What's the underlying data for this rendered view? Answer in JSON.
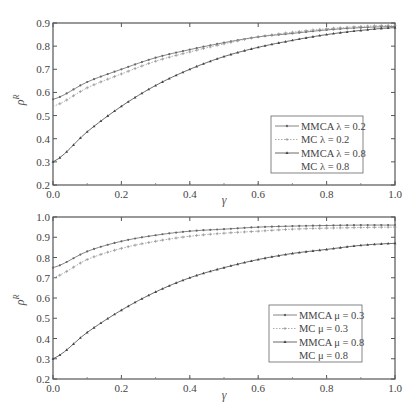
{
  "chart_data": [
    {
      "type": "line",
      "title": "",
      "xlabel": "γ",
      "ylabel": "ρ^R",
      "xlim": [
        0.0,
        1.0
      ],
      "ylim": [
        0.2,
        0.9
      ],
      "xticks": [
        0.0,
        0.2,
        0.4,
        0.6,
        0.8,
        1.0
      ],
      "yticks": [
        0.2,
        0.3,
        0.4,
        0.5,
        0.6,
        0.7,
        0.8,
        0.9
      ],
      "grid": false,
      "legend_position": "lower right",
      "x": [
        0.0,
        0.1,
        0.2,
        0.3,
        0.4,
        0.5,
        0.6,
        0.7,
        0.8,
        0.9,
        1.0
      ],
      "series": [
        {
          "name": "MMCA λ = 0.2",
          "color": "#666666",
          "marker": "dot",
          "dash": "solid",
          "values": [
            0.57,
            0.645,
            0.7,
            0.75,
            0.785,
            0.815,
            0.84,
            0.855,
            0.87,
            0.88,
            0.885
          ]
        },
        {
          "name": "MC λ = 0.2",
          "color": "#999999",
          "marker": "plus",
          "dash": "dotted",
          "values": [
            0.54,
            0.62,
            0.68,
            0.735,
            0.775,
            0.81,
            0.84,
            0.86,
            0.875,
            0.885,
            0.89
          ]
        },
        {
          "name": "MMCA λ = 0.8",
          "color": "#444444",
          "marker": "triangle",
          "dash": "solid",
          "values": [
            0.3,
            0.43,
            0.54,
            0.63,
            0.7,
            0.755,
            0.795,
            0.825,
            0.85,
            0.868,
            0.88
          ]
        },
        {
          "name": "MC λ = 0.8",
          "color": "#bbbbbb",
          "marker": "none",
          "dash": "dotted",
          "values": [
            0.3,
            0.43,
            0.54,
            0.63,
            0.7,
            0.755,
            0.795,
            0.825,
            0.85,
            0.868,
            0.88
          ]
        }
      ]
    },
    {
      "type": "line",
      "title": "",
      "xlabel": "γ",
      "ylabel": "ρ^R",
      "xlim": [
        0.0,
        1.0
      ],
      "ylim": [
        0.2,
        1.0
      ],
      "xticks": [
        0.0,
        0.2,
        0.4,
        0.6,
        0.8,
        1.0
      ],
      "yticks": [
        0.2,
        0.3,
        0.4,
        0.5,
        0.6,
        0.7,
        0.8,
        0.9,
        1.0
      ],
      "grid": false,
      "legend_position": "lower right",
      "x": [
        0.0,
        0.1,
        0.2,
        0.3,
        0.4,
        0.5,
        0.6,
        0.7,
        0.8,
        0.9,
        1.0
      ],
      "series": [
        {
          "name": "MMCA μ = 0.3",
          "color": "#666666",
          "marker": "dot",
          "dash": "solid",
          "values": [
            0.75,
            0.83,
            0.88,
            0.91,
            0.93,
            0.94,
            0.95,
            0.955,
            0.958,
            0.96,
            0.96
          ]
        },
        {
          "name": "MC μ = 0.3",
          "color": "#999999",
          "marker": "plus",
          "dash": "dotted",
          "values": [
            0.7,
            0.79,
            0.845,
            0.88,
            0.905,
            0.92,
            0.93,
            0.94,
            0.945,
            0.948,
            0.95
          ]
        },
        {
          "name": "MMCA μ = 0.8",
          "color": "#444444",
          "marker": "triangle",
          "dash": "solid",
          "values": [
            0.3,
            0.43,
            0.54,
            0.63,
            0.7,
            0.75,
            0.79,
            0.82,
            0.84,
            0.86,
            0.87
          ]
        },
        {
          "name": "MC μ = 0.8",
          "color": "#bbbbbb",
          "marker": "none",
          "dash": "dotted",
          "values": [
            0.3,
            0.43,
            0.54,
            0.63,
            0.7,
            0.75,
            0.79,
            0.82,
            0.84,
            0.86,
            0.87
          ]
        }
      ]
    }
  ],
  "panels": [
    {
      "frame": {
        "left": 53,
        "right": 395,
        "top": 23,
        "bottom": 185
      },
      "legend_box": {
        "x": 271,
        "y": 116,
        "w": 92,
        "h": 57
      },
      "xlabel_pos": {
        "x": 224,
        "y": 204
      },
      "ylabel_pos": {
        "x": 24,
        "y": 100
      }
    },
    {
      "frame": {
        "left": 53,
        "right": 395,
        "top": 217,
        "bottom": 379
      },
      "legend_box": {
        "x": 269,
        "y": 305,
        "w": 93,
        "h": 57
      },
      "xlabel_pos": {
        "x": 224,
        "y": 399
      },
      "ylabel_pos": {
        "x": 24,
        "y": 300
      }
    }
  ]
}
